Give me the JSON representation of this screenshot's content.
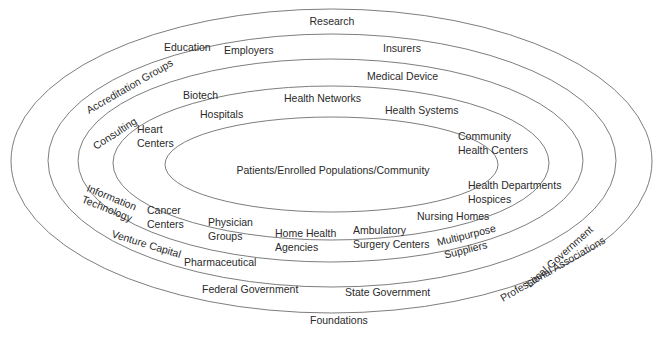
{
  "diagram": {
    "center": {
      "label": "Patients/Enrolled Populations/Community"
    },
    "colors": {
      "ring_stroke": "#6e6e6e",
      "text": "#2a2a2a",
      "background": "#ffffff"
    },
    "rings": [
      {
        "name": "ring-1-inner",
        "labels": [
          "Heart",
          "Centers",
          "Hospitals",
          "Health Networks",
          "Health Systems",
          "Community",
          "Health Centers",
          "Health Departments",
          "Hospices",
          "Nursing Homes",
          "Ambulatory",
          "Surgery Centers",
          "Home Health",
          "Agencies",
          "Physician",
          "Groups",
          "Cancer",
          "Centers"
        ]
      },
      {
        "name": "ring-2",
        "labels": [
          "Biotech",
          "Medical Device",
          "Multipurpose",
          "Suppliers",
          "Pharmaceutical",
          "Information",
          "Technology",
          "Consulting"
        ]
      },
      {
        "name": "ring-3",
        "labels": [
          "Accreditation Groups",
          "Education",
          "Employers",
          "Insurers",
          "Local Government",
          "State Government",
          "Federal Government",
          "Venture Capital"
        ]
      },
      {
        "name": "ring-4-outer",
        "labels": [
          "Research",
          "Professional Associations",
          "Foundations"
        ]
      }
    ],
    "items": {
      "center": "Patients/Enrolled Populations/Community",
      "heart_1": "Heart",
      "heart_2": "Centers",
      "hospitals": "Hospitals",
      "health_networks": "Health Networks",
      "health_systems": "Health Systems",
      "community_1": "Community",
      "community_2": "Health Centers",
      "health_departments": "Health Departments",
      "hospices": "Hospices",
      "nursing_homes": "Nursing Homes",
      "ambulatory_1": "Ambulatory",
      "ambulatory_2": "Surgery Centers",
      "home_health_1": "Home Health",
      "home_health_2": "Agencies",
      "physician_1": "Physician",
      "physician_2": "Groups",
      "cancer_1": "Cancer",
      "cancer_2": "Centers",
      "biotech": "Biotech",
      "medical_device": "Medical Device",
      "multipurpose_1": "Multipurpose",
      "multipurpose_2": "Suppliers",
      "pharmaceutical": "Pharmaceutical",
      "info_tech_1": "Information",
      "info_tech_2": "Technology",
      "consulting": "Consulting",
      "accreditation": "Accreditation Groups",
      "education": "Education",
      "employers": "Employers",
      "insurers": "Insurers",
      "local_government": "Local Government",
      "state_government": "State Government",
      "federal_government": "Federal Government",
      "venture_capital": "Venture Capital",
      "research": "Research",
      "professional_associations": "Professional Associations",
      "foundations": "Foundations"
    }
  }
}
